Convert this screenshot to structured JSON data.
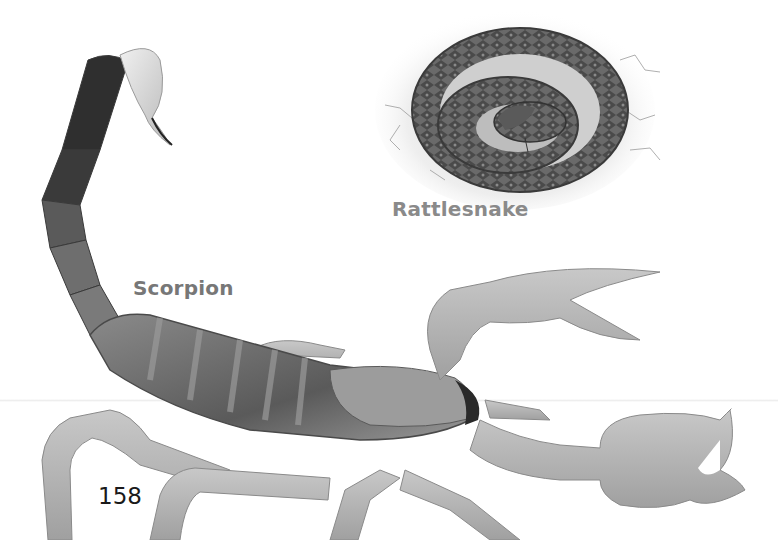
{
  "page": {
    "page_number": "158",
    "color_mode": "grayscale",
    "background": "#ffffff"
  },
  "figures": [
    {
      "name": "scorpion",
      "label": "Scorpion",
      "label_color": "#777777"
    },
    {
      "name": "rattlesnake",
      "label": "Rattlesnake",
      "label_color": "#8a8a8a"
    }
  ]
}
